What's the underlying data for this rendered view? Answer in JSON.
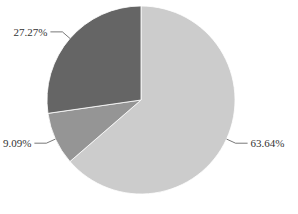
{
  "chart_data": {
    "type": "pie",
    "title": "",
    "categories": [
      "Slice A",
      "Slice B",
      "Slice C"
    ],
    "values": [
      63.64,
      9.09,
      27.27
    ],
    "labels": [
      "63.64%",
      "9.09%",
      "27.27%"
    ],
    "colors": [
      "#cccccc",
      "#959595",
      "#656565"
    ],
    "start_angle_deg": 0,
    "direction": "clockwise",
    "legend": "none"
  }
}
